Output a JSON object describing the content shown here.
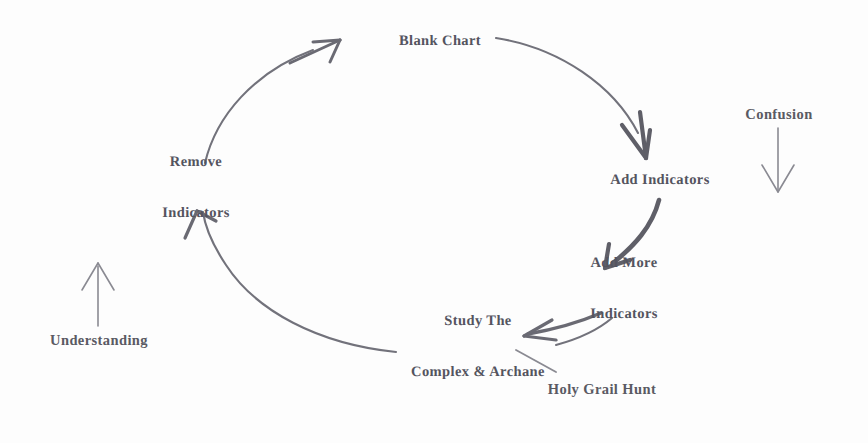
{
  "diagram": {
    "background_color": "#fdfdfd",
    "text_color": "#54545f",
    "stroke_color": "#6f6f78",
    "nodes": [
      {
        "id": "blank-chart",
        "label": "Blank Chart",
        "lines": [
          "Blank Chart"
        ],
        "x": 440,
        "y": 41
      },
      {
        "id": "add-indicators",
        "label": "Add Indicators",
        "lines": [
          "Add Indicators"
        ],
        "x": 660,
        "y": 180
      },
      {
        "id": "add-more-indicators",
        "label": "Add More Indicators",
        "lines": [
          "Add More",
          "Indicators"
        ],
        "x": 624,
        "y": 289
      },
      {
        "id": "study-the-complex-and-archane",
        "label": "Study The Complex & Archane",
        "lines": [
          "Study The",
          "Complex & Archane"
        ],
        "x": 478,
        "y": 347
      },
      {
        "id": "remove-indicators",
        "label": "Remove Indicators",
        "lines": [
          "Remove",
          "Indicators"
        ],
        "x": 196,
        "y": 188
      }
    ],
    "annotations": [
      {
        "id": "confusion",
        "label": "Confusion",
        "x": 779,
        "y": 114
      },
      {
        "id": "understanding",
        "label": "Understanding",
        "x": 99,
        "y": 340
      },
      {
        "id": "holy-grail-hunt",
        "label": "Holy Grail Hunt",
        "x": 602,
        "y": 389
      }
    ]
  }
}
